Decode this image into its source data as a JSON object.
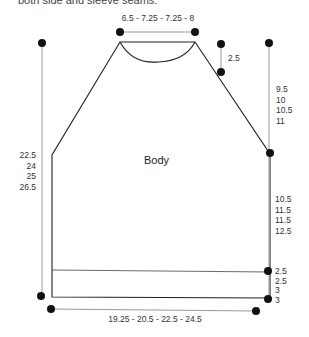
{
  "caption": "both side and sleeve seams.",
  "piece_label": "Body",
  "measurements": {
    "neck_width": "6.5 - 7.25 - 7.25 - 8",
    "shoulder_drop": "2.5",
    "armhole_depth": [
      "9.5",
      "10",
      "10.5",
      "11"
    ],
    "total_length": [
      "22.5",
      "24",
      "25",
      "26.5"
    ],
    "side_length": [
      "10.5",
      "11.5",
      "11.5",
      "12.5"
    ],
    "ribbing": [
      "2.5",
      "2.5",
      "3",
      "3"
    ],
    "bottom_width": "19.25 - 20.5 - 22.5 - 24.5"
  },
  "colors": {
    "outline": "#222222",
    "measure_line": "#999999",
    "dot": "#111111"
  }
}
